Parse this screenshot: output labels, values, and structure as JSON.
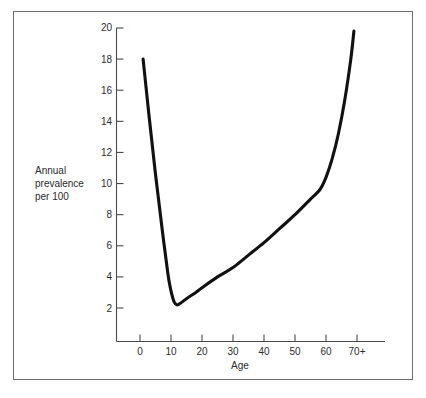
{
  "figure": {
    "background_color": "#ffffff",
    "frame_color": "#6d6d6d",
    "axis_color": "#4a4a4a",
    "curve_color": "#111111",
    "y_axis_title": "Annual\nprevalence\nper 100"
  },
  "chart_data": {
    "type": "line",
    "title": "",
    "subtitle": "",
    "xlabel": "Age",
    "ylabel": "Annual prevalence per 100",
    "xlim": [
      0,
      70
    ],
    "ylim": [
      0,
      20
    ],
    "grid": false,
    "legend": null,
    "x_tick_labels": [
      "0",
      "10",
      "20",
      "30",
      "40",
      "50",
      "60",
      "70+"
    ],
    "x_tick_values": [
      0,
      10,
      20,
      30,
      40,
      50,
      60,
      70
    ],
    "y_tick_labels": [
      "2",
      "4",
      "6",
      "8",
      "10",
      "12",
      "14",
      "16",
      "18",
      "20"
    ],
    "y_tick_values": [
      2,
      4,
      6,
      8,
      10,
      12,
      14,
      16,
      18,
      20
    ],
    "series": [
      {
        "name": "Annual prevalence per 100",
        "x": [
          1,
          3,
          5,
          7,
          9,
          10,
          11,
          12,
          13,
          15,
          18,
          20,
          25,
          30,
          35,
          40,
          45,
          50,
          55,
          58,
          60,
          62,
          64,
          66,
          68,
          69
        ],
        "values": [
          18.0,
          14.2,
          10.6,
          7.3,
          4.2,
          3.1,
          2.4,
          2.2,
          2.3,
          2.6,
          3.0,
          3.3,
          4.0,
          4.6,
          5.4,
          6.2,
          7.1,
          8.0,
          9.0,
          9.6,
          10.4,
          11.6,
          13.2,
          15.3,
          18.0,
          19.8
        ]
      }
    ],
    "annotations": [
      {
        "label": "start",
        "x": 1,
        "y": 18.0
      },
      {
        "label": "minimum",
        "x": 12,
        "y": 2.2
      },
      {
        "label": "knee",
        "x": 58,
        "y": 9.6
      },
      {
        "label": "end",
        "x": 69,
        "y": 19.8
      }
    ]
  }
}
